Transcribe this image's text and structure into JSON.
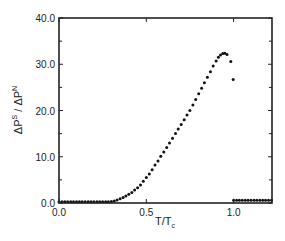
{
  "chart_data": {
    "type": "scatter",
    "title": "",
    "xlabel": "T/T_c",
    "xlabel_main": "T/T",
    "xlabel_sub": "c",
    "ylabel": "ΔP^S / ΔP^N",
    "ylabel_parts": {
      "a": "ΔP",
      "a_sup": "S",
      "sep": " / ΔP",
      "b_sup": "N"
    },
    "xlim": [
      0.0,
      1.22
    ],
    "ylim": [
      0.0,
      40.0
    ],
    "xticks": [
      0.0,
      0.5,
      1.0
    ],
    "xtick_labels": [
      "0.0",
      "0.5",
      "1.0"
    ],
    "yticks": [
      0.0,
      10.0,
      20.0,
      30.0,
      40.0
    ],
    "ytick_labels": [
      "0.0",
      "10.0",
      "20.0",
      "30.0",
      "40.0"
    ],
    "minor_yticks": [
      5.0,
      15.0,
      25.0,
      35.0
    ],
    "grid": false,
    "legend": null,
    "marker_color": "#111111",
    "series": [
      {
        "name": "below Tc",
        "style": "dots",
        "points": [
          [
            0.0,
            0.0
          ],
          [
            0.017,
            0.0
          ],
          [
            0.033,
            0.0
          ],
          [
            0.05,
            0.0
          ],
          [
            0.067,
            0.0
          ],
          [
            0.083,
            0.0
          ],
          [
            0.1,
            0.0
          ],
          [
            0.117,
            0.0
          ],
          [
            0.133,
            0.0
          ],
          [
            0.15,
            0.0
          ],
          [
            0.167,
            0.0
          ],
          [
            0.183,
            0.0
          ],
          [
            0.2,
            0.0
          ],
          [
            0.217,
            0.0
          ],
          [
            0.233,
            0.05
          ],
          [
            0.25,
            0.1
          ],
          [
            0.267,
            0.15
          ],
          [
            0.283,
            0.2
          ],
          [
            0.3,
            0.3
          ],
          [
            0.317,
            0.45
          ],
          [
            0.333,
            0.65
          ],
          [
            0.35,
            0.9
          ],
          [
            0.367,
            1.2
          ],
          [
            0.383,
            1.5
          ],
          [
            0.4,
            1.9
          ],
          [
            0.417,
            2.3
          ],
          [
            0.433,
            2.8
          ],
          [
            0.45,
            3.3
          ],
          [
            0.467,
            3.9
          ],
          [
            0.483,
            4.7
          ],
          [
            0.5,
            5.5
          ],
          [
            0.517,
            6.3
          ],
          [
            0.533,
            7.2
          ],
          [
            0.55,
            8.2
          ],
          [
            0.567,
            9.1
          ],
          [
            0.583,
            10.1
          ],
          [
            0.6,
            11.0
          ],
          [
            0.617,
            12.0
          ],
          [
            0.633,
            13.0
          ],
          [
            0.65,
            14.0
          ],
          [
            0.667,
            15.0
          ],
          [
            0.683,
            16.0
          ],
          [
            0.7,
            17.0
          ],
          [
            0.717,
            18.0
          ],
          [
            0.733,
            19.0
          ],
          [
            0.75,
            20.0
          ],
          [
            0.767,
            21.2
          ],
          [
            0.783,
            22.4
          ],
          [
            0.8,
            23.6
          ],
          [
            0.817,
            24.8
          ],
          [
            0.833,
            26.0
          ],
          [
            0.85,
            27.2
          ],
          [
            0.867,
            28.4
          ],
          [
            0.883,
            29.6
          ],
          [
            0.9,
            30.7
          ],
          [
            0.913,
            31.5
          ],
          [
            0.925,
            32.0
          ],
          [
            0.938,
            32.3
          ],
          [
            0.95,
            32.4
          ],
          [
            0.962,
            32.1
          ],
          [
            0.984,
            30.6
          ],
          [
            0.998,
            26.7
          ]
        ]
      },
      {
        "name": "above Tc",
        "style": "dots",
        "points": [
          [
            1.0,
            0.6
          ],
          [
            1.017,
            0.6
          ],
          [
            1.033,
            0.6
          ],
          [
            1.05,
            0.6
          ],
          [
            1.067,
            0.6
          ],
          [
            1.083,
            0.6
          ],
          [
            1.1,
            0.6
          ],
          [
            1.117,
            0.6
          ],
          [
            1.133,
            0.6
          ],
          [
            1.15,
            0.6
          ],
          [
            1.167,
            0.6
          ],
          [
            1.183,
            0.6
          ],
          [
            1.2,
            0.6
          ],
          [
            1.217,
            0.6
          ]
        ]
      }
    ]
  },
  "layout": {
    "plot_left": 59,
    "plot_top": 18,
    "plot_right": 272,
    "plot_bottom": 203
  }
}
